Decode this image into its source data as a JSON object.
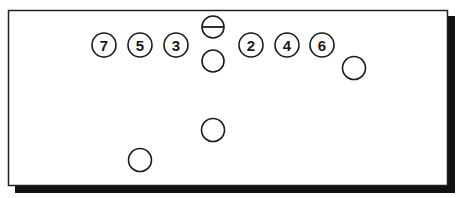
{
  "diagram": {
    "type": "football-formation",
    "frame": {
      "x": 8,
      "y": 10,
      "width": 439,
      "height": 175,
      "border_color": "#222222",
      "shadow_color": "#111111"
    },
    "center": {
      "cx": 213,
      "cy": 27,
      "r": 11,
      "symbol": "circle-with-horizontal-line"
    },
    "numbered_players": [
      {
        "label": "7",
        "cx": 104,
        "cy": 45,
        "r": 12
      },
      {
        "label": "5",
        "cx": 140,
        "cy": 45,
        "r": 12
      },
      {
        "label": "3",
        "cx": 176,
        "cy": 45,
        "r": 12
      },
      {
        "label": "2",
        "cx": 251,
        "cy": 45,
        "r": 12
      },
      {
        "label": "4",
        "cx": 287,
        "cy": 45,
        "r": 12
      },
      {
        "label": "6",
        "cx": 322,
        "cy": 45,
        "r": 12
      }
    ],
    "unnumbered_players": [
      {
        "name": "quarterback",
        "cx": 213,
        "cy": 61,
        "r": 11
      },
      {
        "name": "wide-right",
        "cx": 354,
        "cy": 68,
        "r": 11
      },
      {
        "name": "back-center",
        "cx": 213,
        "cy": 130,
        "r": 11
      },
      {
        "name": "back-left",
        "cx": 140,
        "cy": 160,
        "r": 11
      }
    ]
  }
}
